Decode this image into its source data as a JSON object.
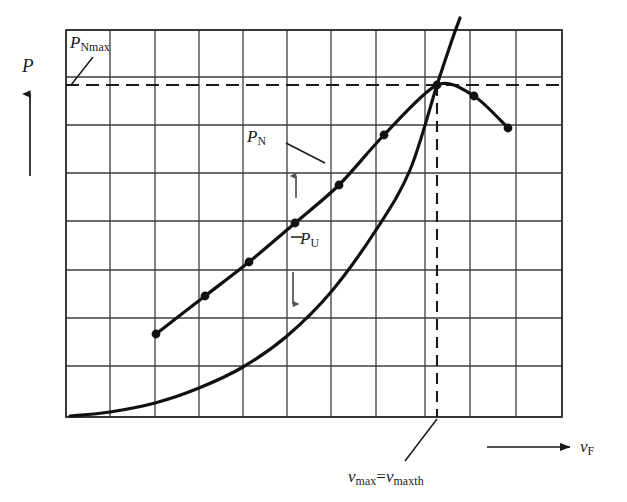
{
  "figure": {
    "kind": "engineering-performance-diagram",
    "axes": {
      "y_axis_label": "P",
      "y_axis_arrow": "up-arrow-icon",
      "x_axis_label_base": "v",
      "x_axis_label_sub": "F",
      "x_axis_arrow": "right-arrow-icon"
    },
    "annotations": {
      "pnmax_base": "P",
      "pnmax_sub": "Nmax",
      "pn_base": "P",
      "pn_sub": "N",
      "pu_base": "P",
      "pu_sub": "U",
      "vmax_base_1": "v",
      "vmax_sub_1": "max",
      "vmax_equals": "=",
      "vmax_base_2": "v",
      "vmax_sub_2": "maxth"
    },
    "colors": {
      "ink": "#1a1a1a",
      "grid": "#3c3c3c",
      "curve": "#111111",
      "background": "#ffffff"
    }
  },
  "chart_data": {
    "type": "line",
    "title": "",
    "xlabel": "v_F",
    "ylabel": "P",
    "grid": true,
    "legend": "inline-annotations",
    "plot_box": {
      "x0": 66,
      "x1": 562,
      "y0": 30,
      "y1": 417
    },
    "grid_lines": {
      "vertical_x": [
        66,
        110,
        155,
        199,
        243,
        287,
        331,
        376,
        425,
        470,
        516,
        562
      ],
      "horizontal_y": [
        30,
        77,
        125,
        173,
        221,
        270,
        318,
        366,
        417
      ]
    },
    "axis_ranges": {
      "xlim": [
        0,
        11
      ],
      "ylim": [
        0,
        8
      ]
    },
    "series": [
      {
        "name": "P_N",
        "style": "solid-with-markers",
        "markers": true,
        "points_px": [
          [
            156,
            334
          ],
          [
            205,
            296
          ],
          [
            249,
            262
          ],
          [
            295,
            223
          ],
          [
            339,
            185
          ],
          [
            384,
            135
          ],
          [
            437,
            85
          ],
          [
            474,
            96
          ],
          [
            508,
            128
          ]
        ],
        "x_units": [
          2.04,
          3.16,
          4.16,
          5.2,
          6.2,
          7.23,
          8.43,
          9.27,
          10.05
        ],
        "y_units": [
          1.72,
          2.5,
          3.2,
          4.01,
          4.79,
          5.82,
          6.86,
          6.63,
          5.97
        ],
        "marker_count": 9,
        "peak_px": [
          437,
          85
        ],
        "note": "net power curve, peaks at v_max"
      },
      {
        "name": "P_U",
        "style": "solid-smooth",
        "markers": false,
        "points_px": [
          [
            70,
            416
          ],
          [
            110,
            412
          ],
          [
            155,
            403
          ],
          [
            199,
            388
          ],
          [
            243,
            367
          ],
          [
            287,
            336
          ],
          [
            331,
            292
          ],
          [
            376,
            230
          ],
          [
            410,
            170
          ],
          [
            437,
            85
          ],
          [
            452,
            40
          ],
          [
            460,
            18
          ]
        ],
        "note": "quadratic drag/consumption curve rising through the P_N peak"
      }
    ],
    "reference_lines": [
      {
        "name": "P_Nmax",
        "orientation": "horizontal",
        "style": "dashed",
        "y_px": 85,
        "x_from_px": 66,
        "x_to_px": 562,
        "label": "P_Nmax"
      },
      {
        "name": "v_max",
        "orientation": "vertical",
        "style": "dashed",
        "x_px": 437,
        "y_from_px": 85,
        "y_to_px": 417,
        "label": "v_max = v_maxth"
      }
    ],
    "leader_lines": [
      {
        "for": "P_Nmax",
        "from_px": [
          92,
          58
        ],
        "to_px": [
          72,
          84
        ]
      },
      {
        "for": "P_N",
        "from_px": [
          288,
          142
        ],
        "to_px": [
          320,
          160
        ]
      },
      {
        "for": "P_N_arrow",
        "from_px": [
          296,
          196
        ],
        "to_px": [
          296,
          172
        ],
        "arrow": "up"
      },
      {
        "for": "P_U",
        "from_px": [
          300,
          238
        ],
        "to_px": [
          292,
          238
        ]
      },
      {
        "for": "P_U_arrow",
        "from_px": [
          293,
          270
        ],
        "to_px": [
          293,
          302
        ],
        "arrow": "down"
      },
      {
        "for": "v_max",
        "from_px": [
          404,
          462
        ],
        "to_px": [
          437,
          420
        ]
      }
    ]
  }
}
